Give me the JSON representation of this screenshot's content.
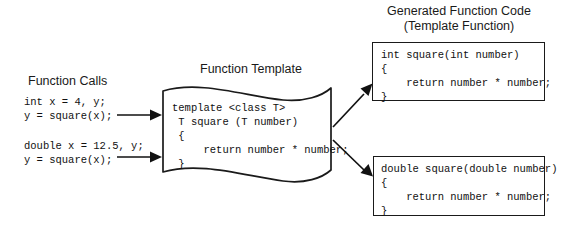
{
  "diagram": {
    "background_color": "#ffffff",
    "stroke_color": "#1a1a1a",
    "width": 567,
    "height": 233
  },
  "function_calls": {
    "heading": "Function Calls",
    "call_int": {
      "line1": "int x = 4, y;",
      "line2": "y = square(x);"
    },
    "call_double": {
      "line1": "double x = 12.5, y;",
      "line2": "y = square(x);"
    }
  },
  "function_template": {
    "heading": "Function Template",
    "code": {
      "line1": "template <class T>",
      "line2": " T square (T number)",
      "line3": " {",
      "line4": "     return number * number;",
      "line5": " }"
    }
  },
  "generated_code": {
    "heading_line1": "Generated Function Code",
    "heading_line2": "(Template Function)",
    "int_version": {
      "line1": "int square(int number)",
      "line2": "{",
      "line3": "    return number * number;",
      "line4": "}"
    },
    "double_version": {
      "line1": "double square(double number)",
      "line2": "{",
      "line3": "    return number * number;",
      "line4": "}"
    }
  },
  "arrows": {
    "call_int_to_template": "arrow-right",
    "call_double_to_template": "arrow-right",
    "template_to_int_code": "arrow-up-right",
    "template_to_double_code": "arrow-down-right"
  }
}
